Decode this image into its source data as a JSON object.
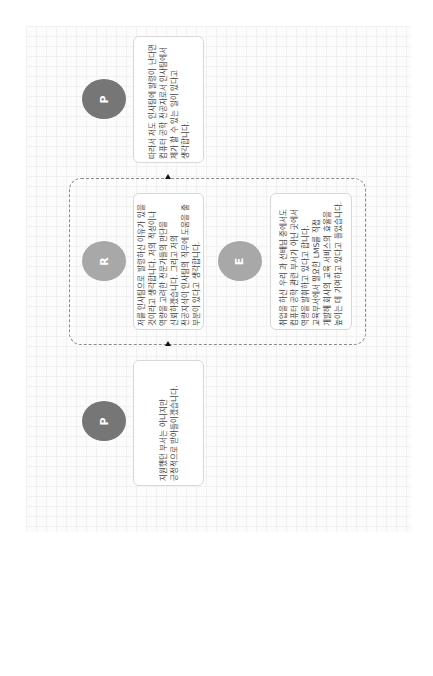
{
  "diagram": {
    "nodes": [
      {
        "id": "p-top",
        "label": "P",
        "text": "따라서 저도 인사팀에 발령이 난다면 컴퓨터 공학 전공자로서 인사팀에서 제가 할 수 있는 일이 있다고 생각합니다."
      },
      {
        "id": "r",
        "label": "R",
        "text": "저를 인사팀으로 발령하신 이유가 있을 것이라고 생각합니다. 저의 적성이나 역량을 고려한 전문가들의 판단을 신뢰하겠습니다. 그리고 저의 전공지식이 인사팀의 직무에 도움을 줄 부분이 있다고 생각합니다."
      },
      {
        "id": "e",
        "label": "E",
        "text": "취업을 하신 우리 과 선배님 중에서도 컴퓨터 공학 관련 부서가 아닌 곳에서 역량을 발휘하고 있다고 합니다. 교육부서에서 필요한 LMS를 직접 개발해 회사의 교육 서비스의 효율을 높이는 데 기여하고 있다고 들었습니다."
      },
      {
        "id": "p-bottom",
        "label": "P",
        "text": "지원했던 부서는 아니지만 긍정적으로 받아들이겠습니다."
      }
    ],
    "colors": {
      "dark_circle": "#767676",
      "light_circle": "#a8a8a8"
    }
  }
}
